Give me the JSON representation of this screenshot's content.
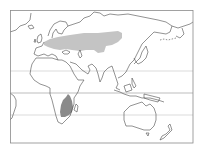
{
  "map": {
    "type": "species-range-map",
    "projection": "equirectangular",
    "extent": {
      "lon_min": -25,
      "lon_max": 185,
      "lat_min": -50,
      "lat_max": 80
    },
    "frame": {
      "x": 10,
      "y": 10,
      "width": 183,
      "height": 133
    },
    "reference_lines": [
      {
        "name": "tropic-of-cancer",
        "y": 71
      },
      {
        "name": "equator",
        "y": 93
      },
      {
        "name": "tropic-of-capricorn",
        "y": 115
      }
    ],
    "ranges": [
      {
        "name": "breeding-range",
        "label": "Eurasia",
        "color": "#c4c4c4"
      },
      {
        "name": "wintering-range",
        "label": "Southern Africa",
        "color": "#8a8a8a"
      }
    ],
    "colors": {
      "background": "#ffffff",
      "coastline": "#555555",
      "frame": "#888888",
      "reference_line": "#cfcfcf"
    }
  }
}
